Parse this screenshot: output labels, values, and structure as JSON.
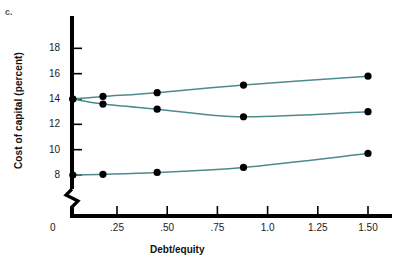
{
  "panel": {
    "label": "c."
  },
  "chart_data": {
    "type": "line",
    "title": "",
    "xlabel": "Debt/equity",
    "ylabel": "Cost of capital (percent)",
    "xlim": [
      0,
      1.62
    ],
    "ylim": [
      7.2,
      19.4
    ],
    "grid": false,
    "legend": "none",
    "y_axis_break": true,
    "xticks": [
      0.25,
      0.5,
      0.75,
      1.0,
      1.25,
      1.5
    ],
    "xticklabels": [
      ".25",
      ".50",
      ".75",
      "1.0",
      "1.25",
      "1.50"
    ],
    "origin_label": "0",
    "yticks": [
      8,
      10,
      12,
      14,
      16,
      18
    ],
    "yticklabels": [
      "8",
      "10",
      "12",
      "14",
      "16",
      "18"
    ],
    "line_color": "#4f8a8b",
    "marker_color": "#000000",
    "series": [
      {
        "name": "Cost of equity",
        "x": [
          0.03,
          0.18,
          0.45,
          0.88,
          1.5
        ],
        "y": [
          14.0,
          14.2,
          14.5,
          15.1,
          15.8
        ]
      },
      {
        "name": "Weighted average cost of capital",
        "x": [
          0.03,
          0.18,
          0.45,
          0.88,
          1.5
        ],
        "y": [
          14.0,
          13.6,
          13.2,
          12.6,
          13.0
        ]
      },
      {
        "name": "Cost of debt",
        "x": [
          0.03,
          0.18,
          0.45,
          0.88,
          1.5
        ],
        "y": [
          8.0,
          8.05,
          8.2,
          8.6,
          9.7
        ]
      }
    ]
  }
}
